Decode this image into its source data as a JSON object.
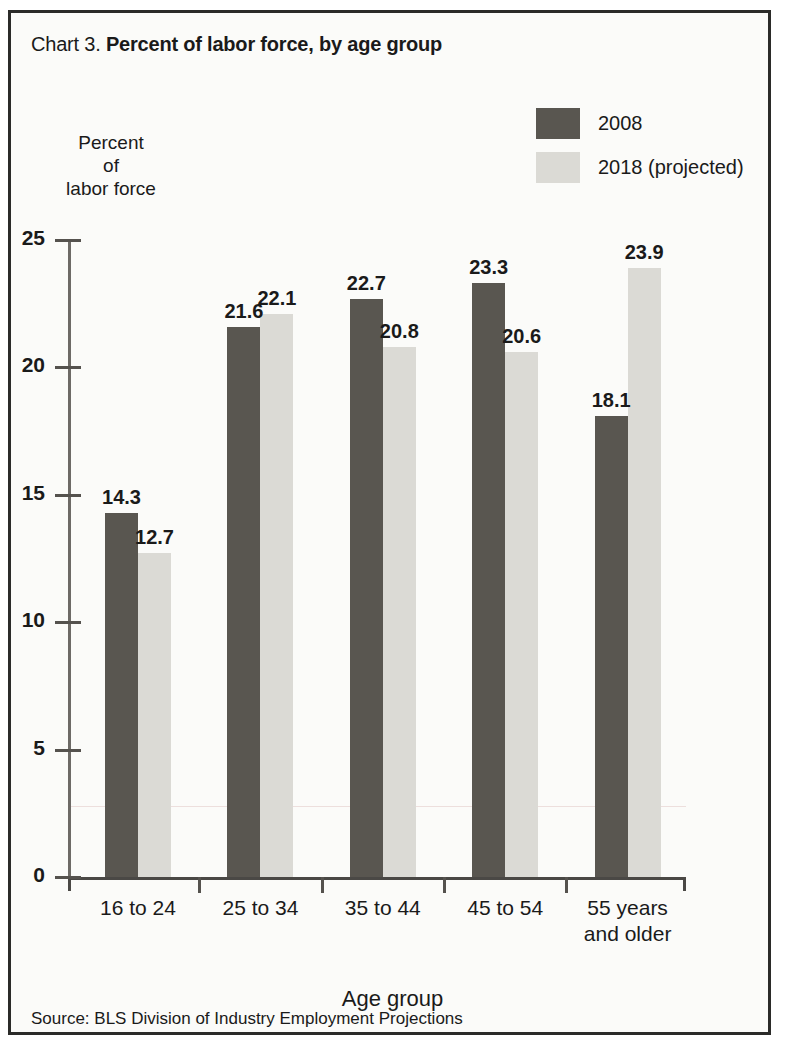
{
  "figure": {
    "chart_number": "Chart 3.",
    "title": "Percent of labor force, by age group",
    "source": "Source: BLS Division of Industry Employment Projections"
  },
  "legend": {
    "items": [
      {
        "label": "2008",
        "color": "#595650",
        "swatch": "dark"
      },
      {
        "label": "2018 (projected)",
        "color": "#dbdad5",
        "swatch": "light"
      }
    ]
  },
  "axes": {
    "y_title": "Percent\nof\nlabor force",
    "y_title_lines": [
      "Percent",
      "of",
      "labor force"
    ],
    "x_title": "Age group",
    "y_ticks": [
      "0",
      "5",
      "10",
      "15",
      "20",
      "25"
    ]
  },
  "chart_data": {
    "type": "bar",
    "title": "Percent of labor force, by age group",
    "subtitle": "",
    "xlabel": "Age group",
    "ylabel": "Percent of labor force",
    "ylim": [
      0,
      25
    ],
    "yticks": [
      0,
      5,
      10,
      15,
      20,
      25
    ],
    "grid": false,
    "legend_position": "top-right",
    "categories": [
      "16 to 24",
      "25 to 34",
      "35 to 44",
      "45 to 54",
      "55 years\nand older"
    ],
    "series": [
      {
        "name": "2008",
        "color": "#595650",
        "values": [
          14.3,
          21.6,
          22.7,
          23.3,
          18.1
        ]
      },
      {
        "name": "2018 (projected)",
        "color": "#dbdad5",
        "values": [
          12.7,
          22.1,
          20.8,
          20.6,
          23.9
        ]
      }
    ],
    "value_labels": [
      [
        "14.3",
        "12.7"
      ],
      [
        "21.6",
        "22.1"
      ],
      [
        "22.7",
        "20.8"
      ],
      [
        "23.3",
        "20.6"
      ],
      [
        "18.1",
        "23.9"
      ]
    ]
  }
}
